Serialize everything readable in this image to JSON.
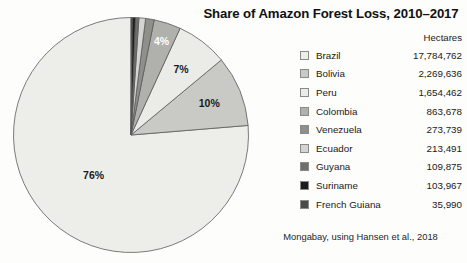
{
  "title": "Share of Amazon Forest Loss, 2010–2017",
  "source_note": "Mongabay, using Hansen et al., 2018",
  "legend": {
    "value_header": "Hectares"
  },
  "chart_data": {
    "type": "pie",
    "title": "Share of Amazon Forest Loss, 2010–2017",
    "value_unit": "Hectares",
    "total_hectares": 23309600,
    "legend_position": "right",
    "start_angle_deg": 90,
    "direction": "counterclockwise",
    "categories": [
      "Brazil",
      "Bolivia",
      "Peru",
      "Colombia",
      "Venezuela",
      "Ecuador",
      "Guyana",
      "Suriname",
      "French Guiana"
    ],
    "values": [
      17784762,
      2269636,
      1654462,
      863678,
      273739,
      213491,
      109875,
      103967,
      35990
    ],
    "value_labels": [
      "17,784,762",
      "2,269,636",
      "1,654,462",
      "863,678",
      "273,739",
      "213,491",
      "109,875",
      "103,967",
      "35,990"
    ],
    "percent_labels": [
      "76%",
      "10%",
      "7%",
      "4%",
      "",
      "",
      "",
      "",
      ""
    ],
    "percents": [
      76.3,
      9.7,
      7.1,
      3.7,
      1.2,
      0.9,
      0.5,
      0.45,
      0.15
    ],
    "colors": [
      "#ededea",
      "#c9c9c6",
      "#ebebe8",
      "#b0b0ad",
      "#8f8f8c",
      "#d4d4d1",
      "#6e6e6b",
      "#1c1c1c",
      "#4a4a48"
    ],
    "slices": [
      {
        "name": "Brazil",
        "value": 17784762,
        "value_label": "17,784,762",
        "percent_label": "76%",
        "color": "#ededea"
      },
      {
        "name": "Bolivia",
        "value": 2269636,
        "value_label": "2,269,636",
        "percent_label": "10%",
        "color": "#c9c9c6"
      },
      {
        "name": "Peru",
        "value": 1654462,
        "value_label": "1,654,462",
        "percent_label": "7%",
        "color": "#ebebe8"
      },
      {
        "name": "Colombia",
        "value": 863678,
        "value_label": "863,678",
        "percent_label": "4%",
        "color": "#b0b0ad"
      },
      {
        "name": "Venezuela",
        "value": 273739,
        "value_label": "273,739",
        "percent_label": "",
        "color": "#8f8f8c"
      },
      {
        "name": "Ecuador",
        "value": 213491,
        "value_label": "213,491",
        "percent_label": "",
        "color": "#d4d4d1"
      },
      {
        "name": "Guyana",
        "value": 109875,
        "value_label": "109,875",
        "percent_label": "",
        "color": "#6e6e6b"
      },
      {
        "name": "Suriname",
        "value": 103967,
        "value_label": "103,967",
        "percent_label": "",
        "color": "#1c1c1c"
      },
      {
        "name": "French Guiana",
        "value": 35990,
        "value_label": "35,990",
        "percent_label": "",
        "color": "#4a4a48"
      }
    ]
  }
}
